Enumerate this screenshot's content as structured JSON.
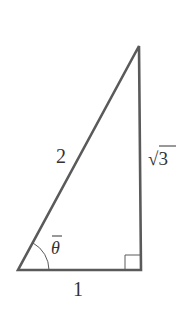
{
  "diagram": {
    "type": "right-triangle",
    "colors": {
      "stroke": "#5a5a5a",
      "text": "#333333",
      "background": "#ffffff"
    },
    "vertices": {
      "bottom_left": [
        18,
        270
      ],
      "bottom_right": [
        141,
        270
      ],
      "top": [
        139,
        46
      ]
    },
    "labels": {
      "hypotenuse": "2",
      "vertical_side": "√3",
      "base": "1",
      "angle": "θ"
    },
    "right_angle_marker": true,
    "angle_arc_at": "bottom_left"
  }
}
